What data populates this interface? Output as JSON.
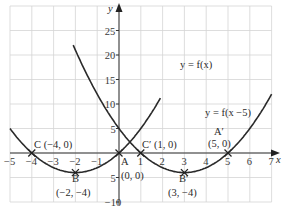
{
  "chart_data": {
    "type": "line",
    "title": "",
    "xlabel": "x",
    "ylabel": "y",
    "xlim": [
      -5,
      7
    ],
    "ylim": [
      -10,
      30
    ],
    "grid": true,
    "x_ticks": [
      "-5",
      "-4",
      "-3",
      "-2",
      "-1",
      "1",
      "2",
      "3",
      "4",
      "5",
      "6",
      "7"
    ],
    "y_ticks": [
      "25",
      "20",
      "15",
      "10",
      "5",
      "5",
      "10"
    ],
    "y_tick_values": [
      25,
      20,
      15,
      10,
      5,
      -5,
      -10
    ],
    "series": [
      {
        "name": "y = f(x)",
        "equation": "(x+2)^2 - 4",
        "x_range": [
          -5,
          1.9
        ]
      },
      {
        "name": "y = f(x −5)",
        "equation": "(x-3)^2 - 4",
        "x_range": [
          -2,
          7
        ]
      }
    ],
    "points": [
      {
        "name": "C",
        "label": "C (−4, 0)",
        "x": -4,
        "y": 0
      },
      {
        "name": "B",
        "label": "B",
        "coords": "(−2, −4)",
        "x": -2,
        "y": -4
      },
      {
        "name": "A",
        "label": "A",
        "coords": "(0, 0)",
        "x": 0,
        "y": 0
      },
      {
        "name": "C'",
        "label": "C′ (1, 0)",
        "x": 1,
        "y": 0
      },
      {
        "name": "B'",
        "label": "B′",
        "coords": "(3, −4)",
        "x": 3,
        "y": -4
      },
      {
        "name": "A'",
        "label": "A′",
        "coords": "(5, 0)",
        "x": 5,
        "y": 0
      }
    ],
    "annotations": [
      "y = f(x)",
      "y = f(x −5)"
    ]
  },
  "labels": {
    "y_axis": "y",
    "x_axis": "x",
    "curve1": "y = f(x)",
    "curve2": "y = f(x −5)",
    "C": "C (−4, 0)",
    "B": "B",
    "B_coords": "(−2, −4)",
    "A": "A",
    "A_coords": "(0, 0)",
    "C_prime": "C′ (1, 0)",
    "B_prime": "B′",
    "B_prime_coords": "(3, −4)",
    "A_prime": "A′",
    "A_prime_coords": "(5, 0)"
  }
}
